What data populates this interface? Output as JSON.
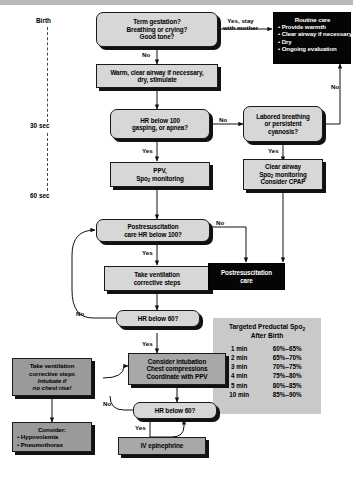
{
  "timeline": {
    "name": "time-axis",
    "marks": [
      {
        "label": "Birth"
      },
      {
        "label": "30 sec"
      },
      {
        "label": "60 sec"
      }
    ]
  },
  "nodes": {
    "assessment": {
      "lines": [
        "Term gestation?",
        "Breathing or crying?",
        "Good tone?"
      ]
    },
    "routine_care": {
      "title": "Routine care",
      "bullets": [
        "• Provide warmth",
        "• Clear airway if necessary",
        "• Dry",
        "• Ongoing evaluation"
      ]
    },
    "warm_clear": {
      "lines": [
        "Warm, clear airway if necessary,",
        "dry, stimulate"
      ]
    },
    "hr100_apnea": {
      "lines": [
        "HR below 100",
        "gasping, or apnea?"
      ]
    },
    "labored_breathing": {
      "lines": [
        "Labored breathing",
        "or persistent",
        "cyanosis?"
      ]
    },
    "ppv": {
      "lines": [
        "PPV,",
        "Spo2 monitoring"
      ]
    },
    "clear_airway": {
      "lines": [
        "Clear airway",
        "Spo2 monitoring",
        "Consider CPAP"
      ]
    },
    "postresus_hr100": {
      "lines": [
        "Postresuscitation",
        "care HR below 100?"
      ]
    },
    "take_vent_steps": {
      "lines": [
        "Take ventilation",
        "corrective steps"
      ]
    },
    "postresus_care": {
      "lines": [
        "Postresuscitation",
        "care"
      ]
    },
    "hr60_mid": {
      "lines": [
        "HR below 60?"
      ]
    },
    "consider_intubation": {
      "lines": [
        "Consider intubation",
        "Chest compressions",
        "Coordinate with PPV"
      ]
    },
    "take_vent_intubate": {
      "lines": [
        "Take ventilation",
        "corrective steps"
      ],
      "italic_lines": [
        "Intubate if",
        "no chest rise!"
      ]
    },
    "hr60_bottom": {
      "lines": [
        "HR below 60?"
      ]
    },
    "iv_epinephrine": {
      "lines": [
        "IV epinephrine"
      ]
    },
    "consider": {
      "title": "Consider:",
      "bullets": [
        "• Hypovolemia",
        "• Pneumothorax"
      ]
    }
  },
  "edge_labels": {
    "yes_stay_mother": [
      "Yes, stay",
      "with mother"
    ],
    "no_1": "No",
    "no_2": "No",
    "no_3": "No",
    "no_4": "No",
    "no_5": "No",
    "no_6": "No",
    "yes_1": "Yes",
    "yes_2": "Yes",
    "yes_3": "Yes",
    "yes_4": "Yes",
    "yes_5": "Yes"
  },
  "spo2_table": {
    "title_line1": "Targeted Preductal Spo",
    "title_sub": "2",
    "title_line2": "After Birth",
    "rows": [
      {
        "time": "1 min",
        "range": "60%–65%"
      },
      {
        "time": "2 min",
        "range": "65%–70%"
      },
      {
        "time": "3 min",
        "range": "70%–75%"
      },
      {
        "time": "4 min",
        "range": "75%–80%"
      },
      {
        "time": "5 min",
        "range": "80%–85%"
      },
      {
        "time": "10 min",
        "range": "85%–90%"
      }
    ]
  },
  "colors": {
    "box_light": "#d2d2d2",
    "box_mid": "#a8a8a8",
    "box_dark": "#9a9a9a",
    "black_box": "#050505",
    "table_bg": "#c9c9c9",
    "outline": "#1a1a1a"
  }
}
